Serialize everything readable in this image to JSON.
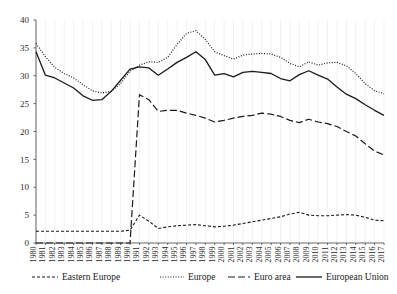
{
  "chart_data": {
    "type": "line",
    "title": "",
    "xlabel": "",
    "ylabel": "",
    "ylim": [
      0,
      40
    ],
    "ytick_step": 5,
    "grid": "vertical-light",
    "legend_position": "bottom",
    "x": [
      1980,
      1981,
      1982,
      1983,
      1984,
      1985,
      1986,
      1987,
      1988,
      1989,
      1990,
      1991,
      1992,
      1993,
      1994,
      1995,
      1996,
      1997,
      1998,
      1999,
      2000,
      2001,
      2002,
      2003,
      2004,
      2005,
      2006,
      2007,
      2008,
      2009,
      2010,
      2011,
      2012,
      2013,
      2014,
      2015,
      2016,
      2017
    ],
    "yticks": [
      0,
      5,
      10,
      15,
      20,
      25,
      30,
      35,
      40
    ],
    "xticklabels": [
      "1980",
      "1981",
      "1982",
      "1983",
      "1984",
      "1985",
      "1986",
      "1987",
      "1988",
      "1989",
      "1990",
      "1991",
      "1992",
      "1993",
      "1994",
      "1995",
      "1996",
      "1997",
      "1998",
      "1999",
      "2000",
      "2001",
      "2002",
      "2003",
      "2004",
      "2005",
      "2006",
      "2007",
      "2008",
      "2009",
      "2010",
      "2011",
      "2012",
      "2013",
      "2014",
      "2015",
      "2016",
      "2017"
    ],
    "series": [
      {
        "name": "Eastern Europe",
        "style": "short-dash",
        "dasharray": "3,2",
        "width": 1.1,
        "color": "#1a1a1a",
        "values": [
          2.1,
          2.1,
          2.1,
          2.1,
          2.1,
          2.1,
          2.1,
          2.1,
          2.1,
          2.1,
          2.3,
          5.0,
          3.9,
          2.6,
          2.9,
          3.1,
          3.2,
          3.3,
          3.1,
          2.9,
          3.0,
          3.2,
          3.5,
          3.8,
          4.1,
          4.4,
          4.7,
          5.2,
          5.5,
          5.0,
          4.9,
          4.9,
          5.0,
          5.1,
          5.0,
          4.6,
          4.1,
          4.0
        ]
      },
      {
        "name": "Europe",
        "style": "dotted",
        "dasharray": "1,1.6",
        "width": 1.2,
        "color": "#1a1a1a",
        "values": [
          35.8,
          33.4,
          31.5,
          30.4,
          29.6,
          28.4,
          27.3,
          26.9,
          27.2,
          28.6,
          30.8,
          31.9,
          32.5,
          32.4,
          33.3,
          35.6,
          37.6,
          38.1,
          36.5,
          34.3,
          33.6,
          33.0,
          33.7,
          33.9,
          34.0,
          33.9,
          33.3,
          32.2,
          31.6,
          32.5,
          31.9,
          32.3,
          32.4,
          31.8,
          30.4,
          28.6,
          27.3,
          26.8
        ]
      },
      {
        "name": "Euro area",
        "style": "long-dash",
        "dasharray": "7,3",
        "width": 1.2,
        "color": "#1a1a1a",
        "values": [
          0,
          0,
          0,
          0,
          0,
          0,
          0,
          0,
          0,
          0,
          0,
          26.6,
          25.7,
          23.6,
          23.8,
          23.8,
          23.3,
          22.9,
          22.4,
          21.7,
          22.0,
          22.4,
          22.7,
          22.9,
          23.3,
          23.1,
          22.7,
          22.0,
          21.6,
          22.2,
          21.7,
          21.4,
          20.9,
          20.0,
          19.2,
          17.8,
          16.5,
          15.8
        ]
      },
      {
        "name": "European Union",
        "style": "solid",
        "dasharray": "",
        "width": 1.3,
        "color": "#1a1a1a",
        "values": [
          34.3,
          30.1,
          29.6,
          28.7,
          27.8,
          26.4,
          25.6,
          25.7,
          27.2,
          29.2,
          31.2,
          31.6,
          31.4,
          30.1,
          31.2,
          32.4,
          33.3,
          34.3,
          32.9,
          30.1,
          30.4,
          29.8,
          30.6,
          30.8,
          30.6,
          30.4,
          29.5,
          29.1,
          30.2,
          30.9,
          30.1,
          29.4,
          28.0,
          26.7,
          25.9,
          24.8,
          23.8,
          22.9
        ]
      }
    ]
  },
  "legend": {
    "items": [
      {
        "label": "Eastern Europe"
      },
      {
        "label": "Europe"
      },
      {
        "label": "Euro area"
      },
      {
        "label": "European Union"
      }
    ]
  }
}
